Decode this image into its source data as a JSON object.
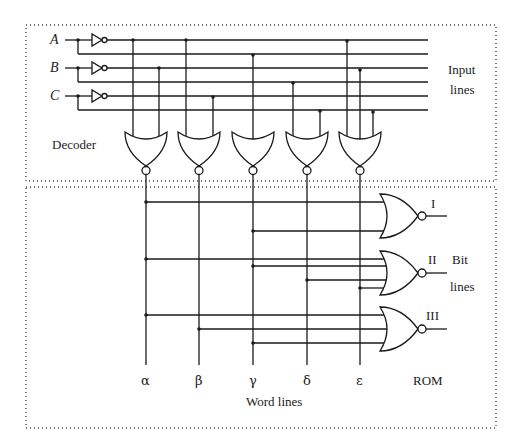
{
  "sections": {
    "decoder": {
      "label": "Decoder",
      "input_lines_label_1": "Input",
      "input_lines_label_2": "lines",
      "inputs": [
        "A",
        "B",
        "C"
      ]
    },
    "rom": {
      "label": "ROM",
      "bit_lines_label_1": "Bit",
      "bit_lines_label_2": "lines",
      "word_lines_label": "Word lines",
      "word_lines": [
        "α",
        "β",
        "γ",
        "δ",
        "ε"
      ],
      "bit_outputs": [
        "I",
        "II",
        "III"
      ]
    }
  },
  "colors": {
    "wire": "#1a1a1a",
    "border": "#444444",
    "background": "#ffffff"
  }
}
